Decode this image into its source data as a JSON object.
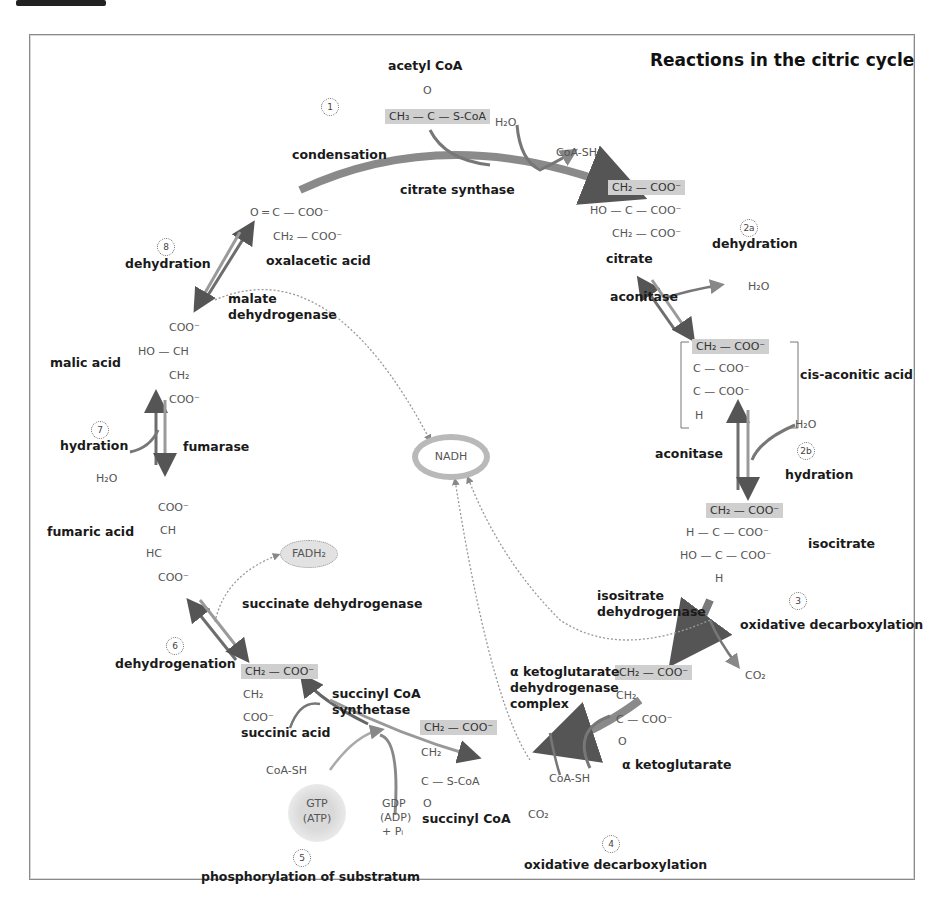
{
  "title": "Reactions in the citric cycle",
  "colors": {
    "arrow": "#6f6f6f",
    "highlight": "#cfcfcf",
    "frame": "#8a8a8a"
  },
  "cofactors": {
    "nadh": "NADH",
    "fadh2": "FADH₂",
    "gtp": "GTP",
    "atp": "(ATP)"
  },
  "molecules": {
    "acetyl_coa": {
      "name": "acetyl CoA",
      "line1": "O",
      "line2": "CH₃ — C — S-CoA"
    },
    "citrate": {
      "name": "citrate",
      "lines": [
        "CH₂ — COO⁻",
        "HO — C — COO⁻",
        "CH₂ — COO⁻"
      ]
    },
    "cis_aconitic": {
      "name": "cis-aconitic acid",
      "lines": [
        "CH₂ — COO⁻",
        "C — COO⁻",
        "C — COO⁻",
        "H"
      ]
    },
    "isocitrate": {
      "name": "isocitrate",
      "lines": [
        "CH₂ — COO⁻",
        "H — C — COO⁻",
        "HO — C — COO⁻",
        "H"
      ]
    },
    "alpha_ketoglutarate": {
      "name": "α ketoglutarate",
      "lines": [
        "CH₂ — COO⁻",
        "CH₂",
        "C — COO⁻",
        "O"
      ]
    },
    "succinyl_coa": {
      "name": "succinyl CoA",
      "lines": [
        "CH₂ — COO⁻",
        "CH₂",
        "C — S-CoA",
        "O"
      ]
    },
    "succinic_acid": {
      "name": "succinic acid",
      "lines": [
        "CH₂ — COO⁻",
        "CH₂",
        "COO⁻"
      ]
    },
    "fumaric_acid": {
      "name": "fumaric acid",
      "lines": [
        "COO⁻",
        "CH",
        "HC",
        "COO⁻"
      ]
    },
    "malic_acid": {
      "name": "malic acid",
      "lines": [
        "COO⁻",
        "HO — CH",
        "CH₂",
        "COO⁻"
      ]
    },
    "oxalacetic_acid": {
      "name": "oxalacetic acid",
      "lines": [
        "O ═ C — COO⁻",
        "CH₂ — COO⁻"
      ]
    }
  },
  "steps": [
    {
      "num": "1",
      "reaction": "condensation",
      "enzyme": "citrate synthase"
    },
    {
      "num": "2a",
      "reaction": "dehydration",
      "enzyme": "aconitase"
    },
    {
      "num": "2b",
      "reaction": "hydration",
      "enzyme": "aconitase"
    },
    {
      "num": "3",
      "reaction": "oxidative decarboxylation",
      "enzyme": "isositrate dehydrogenase"
    },
    {
      "num": "4",
      "reaction": "oxidative decarboxylation",
      "enzyme": "α ketoglutarate dehydrogenase complex"
    },
    {
      "num": "5",
      "reaction": "phosphorylation of substratum",
      "enzyme": "succinyl CoA synthetase"
    },
    {
      "num": "6",
      "reaction": "dehydrogenation",
      "enzyme": "succinate dehydrogenase"
    },
    {
      "num": "7",
      "reaction": "hydration",
      "enzyme": "fumarase"
    },
    {
      "num": "8",
      "reaction": "dehydration",
      "enzyme": "malate dehydrogenase"
    }
  ],
  "enzyme_lines": {
    "malate": [
      "malate",
      "dehydrogenase"
    ],
    "isocitrate_dh": [
      "isositrate",
      "dehydrogenase"
    ],
    "akg_dh": [
      "α ketoglutarate",
      "dehydrogenase",
      "complex"
    ],
    "succ_coa_syn": [
      "succinyl CoA",
      "synthetase"
    ]
  },
  "side_products": {
    "h2o_top": "H₂O",
    "coash_top": "CoA-SH",
    "h2o_2a": "H₂O",
    "h2o_2b": "H₂O",
    "co2_3": "CO₂",
    "coash_4": "CoA-SH",
    "co2_4": "CO₂",
    "coash_5": "CoA-SH",
    "gdp": "GDP",
    "adp": "(ADP)",
    "pi": "+ Pᵢ",
    "h2o_7": "H₂O"
  }
}
